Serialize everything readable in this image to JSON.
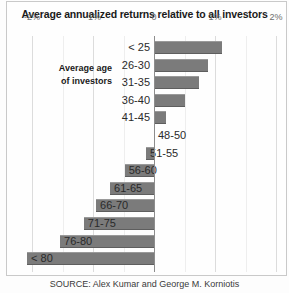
{
  "chart_data": {
    "type": "bar",
    "orientation": "horizontal",
    "title": "Average annualized returns relative to all investors",
    "xlabel": "",
    "ylabel": "Average age of investors",
    "categories": [
      "< 25",
      "26-30",
      "31-35",
      "36-40",
      "41-45",
      "48-50",
      "51-55",
      "56-60",
      "61-65",
      "66-70",
      "71-75",
      "76-80",
      "< 80"
    ],
    "values": [
      1.12,
      0.88,
      0.73,
      0.5,
      0.2,
      0.0,
      -0.13,
      -0.48,
      -0.72,
      -0.95,
      -1.15,
      -1.54,
      -2.08
    ],
    "xlim": [
      -2.25,
      2.2
    ],
    "ticks": [
      -2,
      -1,
      0,
      1,
      2
    ],
    "tick_labels": [
      "-2%",
      "-1%",
      "0",
      "1%",
      "2%"
    ],
    "grid": true,
    "legend": "none",
    "bar_color": "#7b7b7b",
    "zero_axis_color": "#8d8d8d"
  },
  "axis_caption": {
    "line1": "Average age",
    "line2": "of investors"
  },
  "source": {
    "text": "SOURCE: Alex Kumar and George M. Korniotis"
  }
}
